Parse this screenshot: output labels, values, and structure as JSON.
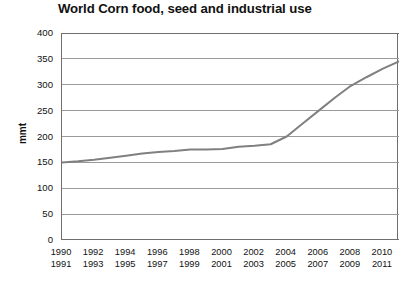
{
  "chart_data": {
    "type": "line",
    "title": "World Corn food, seed and industrial use",
    "xlabel": "",
    "ylabel": "mmt",
    "ylim": [
      0,
      400
    ],
    "ytick_step": 50,
    "yticks": [
      "400",
      "350",
      "300",
      "250",
      "200",
      "150",
      "100",
      "50",
      "0"
    ],
    "grid": "horizontal",
    "legend": "none",
    "line_color": "#808080",
    "grid_color": "#9a9a9a",
    "axis_color": "#6f6f6f",
    "x": [
      1990,
      1991,
      1992,
      1993,
      1994,
      1995,
      1996,
      1997,
      1998,
      1999,
      2000,
      2001,
      2002,
      2003,
      2004,
      2005,
      2006,
      2007,
      2008,
      2009,
      2010,
      2011
    ],
    "values": [
      150,
      152,
      155,
      159,
      163,
      167,
      170,
      172,
      175,
      175,
      176,
      180,
      182,
      185,
      200,
      225,
      250,
      275,
      298,
      315,
      331,
      345
    ],
    "xtick_years_top": [
      "1990",
      "1992",
      "1994",
      "1996",
      "1998",
      "2000",
      "2002",
      "2004",
      "2006",
      "2008",
      "2010"
    ],
    "xtick_years_bottom": [
      "1991",
      "1993",
      "1995",
      "1997",
      "1999",
      "2001",
      "2003",
      "2005",
      "2007",
      "2009",
      "2011"
    ]
  }
}
